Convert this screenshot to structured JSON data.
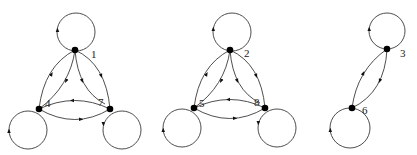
{
  "diagram": {
    "type": "directed-graphs-with-self-loops",
    "colors": {
      "edge": "#3a3a3a",
      "node": "#000000",
      "label": "#222222"
    },
    "graphs": [
      {
        "id": "graph-a",
        "nodes": [
          {
            "label": "1",
            "x": 75,
            "y": 50
          },
          {
            "label": "4",
            "x": 39,
            "y": 109
          },
          {
            "label": "7",
            "x": 110,
            "y": 109
          }
        ],
        "edges": [
          {
            "from": "1",
            "to": "1",
            "kind": "self-loop"
          },
          {
            "from": "4",
            "to": "4",
            "kind": "self-loop"
          },
          {
            "from": "7",
            "to": "7",
            "kind": "self-loop"
          },
          {
            "from": "4",
            "to": "1",
            "kind": "outer-curve"
          },
          {
            "from": "1",
            "to": "4",
            "kind": "inner-curve"
          },
          {
            "from": "1",
            "to": "7",
            "kind": "inner-curve"
          },
          {
            "from": "1",
            "to": "7",
            "kind": "outer-curve"
          },
          {
            "from": "7",
            "to": "4",
            "kind": "upper-curve"
          },
          {
            "from": "4",
            "to": "7",
            "kind": "lower-curve"
          }
        ]
      },
      {
        "id": "graph-b",
        "nodes": [
          {
            "label": "2",
            "x": 230,
            "y": 50
          },
          {
            "label": "5",
            "x": 194,
            "y": 108
          },
          {
            "label": "8",
            "x": 265,
            "y": 108
          }
        ],
        "edges": [
          {
            "from": "2",
            "to": "2",
            "kind": "self-loop"
          },
          {
            "from": "5",
            "to": "5",
            "kind": "self-loop"
          },
          {
            "from": "8",
            "to": "8",
            "kind": "self-loop"
          },
          {
            "from": "5",
            "to": "2",
            "kind": "outer-curve"
          },
          {
            "from": "2",
            "to": "5",
            "kind": "inner-curve"
          },
          {
            "from": "2",
            "to": "8",
            "kind": "inner-curve"
          },
          {
            "from": "2",
            "to": "8",
            "kind": "outer-curve"
          },
          {
            "from": "8",
            "to": "5",
            "kind": "upper-curve"
          },
          {
            "from": "5",
            "to": "8",
            "kind": "lower-curve"
          }
        ]
      },
      {
        "id": "graph-c",
        "nodes": [
          {
            "label": "3",
            "x": 387,
            "y": 49
          },
          {
            "label": "6",
            "x": 352,
            "y": 108
          }
        ],
        "edges": [
          {
            "from": "3",
            "to": "3",
            "kind": "self-loop"
          },
          {
            "from": "6",
            "to": "6",
            "kind": "self-loop"
          },
          {
            "from": "6",
            "to": "3",
            "kind": "left-curve"
          },
          {
            "from": "3",
            "to": "6",
            "kind": "right-curve"
          }
        ]
      }
    ]
  }
}
